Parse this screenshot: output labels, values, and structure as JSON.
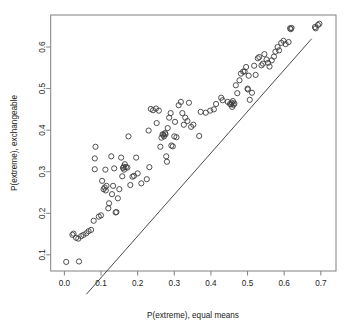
{
  "chart_data": {
    "type": "scatter",
    "title": "",
    "xlabel": "P(extreme), equal means",
    "ylabel": "P(extreme), exchangeable",
    "xlim": [
      -0.0373,
      0.7414
    ],
    "ylim": [
      0.0611,
      0.6771
    ],
    "xticks": [
      0.0,
      0.1,
      0.2,
      0.3,
      0.4,
      0.5,
      0.6,
      0.7
    ],
    "xtick_labels": [
      "0.0",
      "0.1",
      "0.2",
      "0.3",
      "0.4",
      "0.5",
      "0.6",
      "0.7"
    ],
    "yticks": [
      0.1,
      0.2,
      0.3,
      0.4,
      0.5,
      0.6
    ],
    "ytick_labels": [
      "0.1",
      "0.2",
      "0.3",
      "0.4",
      "0.5",
      "0.6"
    ],
    "grid": false,
    "legend": null,
    "point_marker": "open-circle",
    "point_color": "#3d3d3d",
    "point_radius_px": 2.6,
    "reference_line": {
      "label": "identity-shifted line",
      "slope": 1.0,
      "intercept": -0.055,
      "color": "#4a4a4a",
      "x_start": 0.06,
      "x_end": 0.675
    },
    "x": [
      0.005,
      0.04,
      0.022,
      0.025,
      0.032,
      0.038,
      0.046,
      0.052,
      0.06,
      0.066,
      0.073,
      0.08,
      0.083,
      0.083,
      0.085,
      0.094,
      0.1,
      0.103,
      0.107,
      0.11,
      0.112,
      0.113,
      0.115,
      0.12,
      0.122,
      0.128,
      0.13,
      0.133,
      0.136,
      0.14,
      0.142,
      0.146,
      0.15,
      0.155,
      0.158,
      0.16,
      0.162,
      0.163,
      0.165,
      0.168,
      0.172,
      0.175,
      0.18,
      0.186,
      0.19,
      0.196,
      0.2,
      0.21,
      0.225,
      0.23,
      0.232,
      0.236,
      0.242,
      0.25,
      0.252,
      0.258,
      0.262,
      0.265,
      0.268,
      0.27,
      0.272,
      0.275,
      0.276,
      0.278,
      0.28,
      0.282,
      0.286,
      0.29,
      0.292,
      0.296,
      0.3,
      0.302,
      0.306,
      0.312,
      0.318,
      0.322,
      0.326,
      0.33,
      0.336,
      0.34,
      0.346,
      0.352,
      0.368,
      0.372,
      0.386,
      0.398,
      0.408,
      0.414,
      0.428,
      0.432,
      0.446,
      0.452,
      0.455,
      0.457,
      0.458,
      0.46,
      0.462,
      0.464,
      0.468,
      0.472,
      0.478,
      0.482,
      0.488,
      0.492,
      0.496,
      0.5,
      0.501,
      0.503,
      0.506,
      0.512,
      0.518,
      0.522,
      0.528,
      0.532,
      0.538,
      0.542,
      0.546,
      0.552,
      0.556,
      0.56,
      0.566,
      0.572,
      0.576,
      0.582,
      0.586,
      0.592,
      0.598,
      0.604,
      0.612,
      0.616,
      0.618,
      0.62,
      0.684,
      0.686,
      0.692,
      0.696
    ],
    "y": [
      0.083,
      0.084,
      0.148,
      0.151,
      0.141,
      0.139,
      0.145,
      0.148,
      0.152,
      0.157,
      0.16,
      0.182,
      0.306,
      0.332,
      0.36,
      0.192,
      0.195,
      0.278,
      0.258,
      0.262,
      0.305,
      0.255,
      0.266,
      0.212,
      0.224,
      0.337,
      0.246,
      0.266,
      0.308,
      0.202,
      0.203,
      0.236,
      0.258,
      0.334,
      0.289,
      0.309,
      0.312,
      0.305,
      0.318,
      0.311,
      0.31,
      0.385,
      0.268,
      0.288,
      0.29,
      0.334,
      0.296,
      0.272,
      0.282,
      0.399,
      0.311,
      0.451,
      0.448,
      0.452,
      0.417,
      0.447,
      0.36,
      0.382,
      0.39,
      0.389,
      0.385,
      0.393,
      0.39,
      0.337,
      0.324,
      0.405,
      0.43,
      0.441,
      0.363,
      0.361,
      0.385,
      0.42,
      0.383,
      0.46,
      0.468,
      0.441,
      0.413,
      0.43,
      0.422,
      0.466,
      0.408,
      0.413,
      0.386,
      0.444,
      0.442,
      0.447,
      0.45,
      0.463,
      0.478,
      0.472,
      0.468,
      0.463,
      0.462,
      0.466,
      0.456,
      0.47,
      0.461,
      0.464,
      0.508,
      0.489,
      0.52,
      0.536,
      0.541,
      0.541,
      0.552,
      0.5,
      0.498,
      0.531,
      0.473,
      0.49,
      0.555,
      0.533,
      0.573,
      0.576,
      0.556,
      0.56,
      0.583,
      0.57,
      0.562,
      0.553,
      0.568,
      0.577,
      0.589,
      0.6,
      0.592,
      0.61,
      0.615,
      0.607,
      0.612,
      0.645,
      0.643,
      0.646,
      0.648,
      0.645,
      0.653,
      0.656
    ]
  },
  "axes": {
    "x_axis_name": "x-axis",
    "y_axis_name": "y-axis"
  }
}
